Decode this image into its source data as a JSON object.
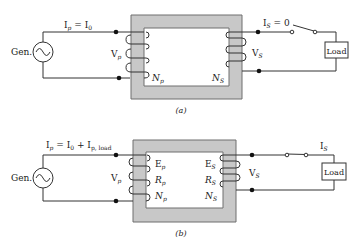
{
  "colors": {
    "core_fill": "#c8c8c8",
    "core_stroke": "#6e6e6e",
    "wire": "#333333",
    "background": "#ffffff"
  },
  "diagram_a": {
    "caption": "(a)",
    "generator_label": "Gen.",
    "primary_current": {
      "I": "I",
      "sub_p": "p",
      "eq": " = I",
      "sub_0": "0"
    },
    "primary_voltage": {
      "V": "V",
      "sub": "p"
    },
    "primary_turns": {
      "N": "N",
      "sub": "p"
    },
    "secondary_current": {
      "I": "I",
      "sub": "S",
      "eq": " = 0"
    },
    "secondary_voltage": {
      "V": "V",
      "sub": "S"
    },
    "secondary_turns": {
      "N": "N",
      "sub": "S"
    },
    "switch_state": "open",
    "load_label": "Load"
  },
  "diagram_b": {
    "caption": "(b)",
    "generator_label": "Gen.",
    "primary_current": {
      "I": "I",
      "sub_p": "p",
      "eq": " = I",
      "sub_0": "0",
      "plus": " + I",
      "sub_load": "p, load"
    },
    "primary_voltage": {
      "V": "V",
      "sub": "p"
    },
    "primary_E": {
      "E": "E",
      "sub": "p"
    },
    "primary_R": {
      "R": "R",
      "sub": "p"
    },
    "primary_turns": {
      "N": "N",
      "sub": "p"
    },
    "secondary_current": {
      "I": "I",
      "sub": "S"
    },
    "secondary_voltage": {
      "V": "V",
      "sub": "S"
    },
    "secondary_E": {
      "E": "E",
      "sub": "S"
    },
    "secondary_R": {
      "R": "R",
      "sub": "S"
    },
    "secondary_turns": {
      "N": "N",
      "sub": "S"
    },
    "switch_state": "closed",
    "load_label": "Load"
  }
}
